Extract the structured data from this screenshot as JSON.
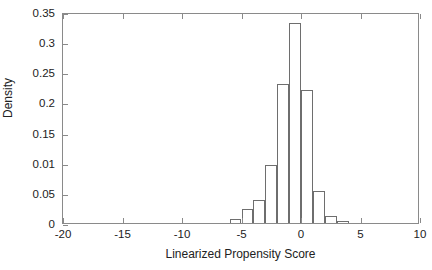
{
  "chart_data": {
    "type": "bar",
    "title": "",
    "xlabel": "Linearized Propensity Score",
    "ylabel": "Density",
    "xlim": [
      -20,
      10
    ],
    "ylim": [
      0,
      0.35
    ],
    "grid": false,
    "legend": null,
    "bin_width": 1,
    "bin_edges": [
      -6,
      -5,
      -4,
      -3,
      -2,
      -1,
      0,
      1,
      2,
      3,
      4
    ],
    "categories": [
      "-6 to -5",
      "-5 to -4",
      "-4 to -3",
      "-3 to -2",
      "-2 to -1",
      "-1 to 0",
      "0 to 1",
      "1 to 2",
      "2 to 3",
      "3 to 4"
    ],
    "bin_centers": [
      -5.5,
      -4.5,
      -3.5,
      -2.5,
      -1.5,
      -0.5,
      0.5,
      1.5,
      2.5,
      3.5
    ],
    "values": [
      0.006,
      0.023,
      0.039,
      0.096,
      0.231,
      0.332,
      0.22,
      0.053,
      0.012,
      0.003
    ],
    "xticks": [
      -20,
      -15,
      -10,
      -5,
      0,
      5,
      10
    ],
    "xtick_labels": [
      "-20",
      "-15",
      "-10",
      "-5",
      "0",
      "5",
      "10"
    ],
    "yticks": [
      0,
      0.05,
      0.1,
      0.15,
      0.2,
      0.25,
      0.3,
      0.35
    ],
    "ytick_labels": [
      "0",
      "0.05",
      "0.01",
      "0.15",
      "0.2",
      "0.25",
      "0.3",
      "0.35"
    ],
    "colors": {
      "bar_edge": "#6e6e6e",
      "bar_fill": "transparent",
      "axis": "#8a8a8a",
      "text": "#222222",
      "background": "#ffffff"
    }
  }
}
